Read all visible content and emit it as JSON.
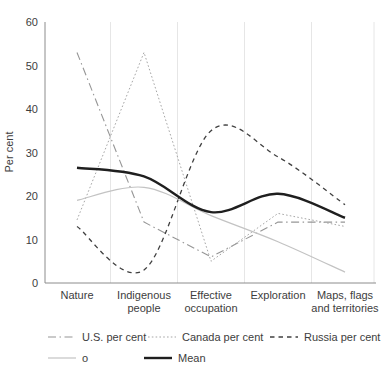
{
  "figure": {
    "background": "#ffffff",
    "ylabel": "Per cent"
  },
  "chart_data": {
    "type": "line",
    "title": "",
    "xlabel": "",
    "ylabel": "Per cent",
    "ylim": [
      0,
      60
    ],
    "yticks": [
      0,
      10,
      20,
      30,
      40,
      50,
      60
    ],
    "grid": "vertical light-gray lines at category band edges",
    "legend_position": "bottom, two rows",
    "categories": [
      "Nature",
      "Indigenous people",
      "Effective occupation",
      "Exploration",
      "Maps, flags and territories"
    ],
    "category_label_lines": [
      [
        "Nature"
      ],
      [
        "Indigenous",
        "people"
      ],
      [
        "Effective",
        "occupation"
      ],
      [
        "Exploration"
      ],
      [
        "Maps, flags",
        "and territories"
      ]
    ],
    "series": [
      {
        "name": "U.S. per cent",
        "values": [
          53,
          14,
          6,
          14,
          14
        ],
        "color": "#969696",
        "style": "dash-dot",
        "width": 1.1,
        "smooth": false
      },
      {
        "name": "Canada per cent",
        "values": [
          14.5,
          53,
          5,
          16,
          13
        ],
        "color": "#a6a6a6",
        "style": "dotted",
        "width": 1.0,
        "smooth": false
      },
      {
        "name": "Russia per cent",
        "values": [
          13,
          3,
          35,
          29,
          18
        ],
        "color": "#404040",
        "style": "dashed",
        "width": 1.3,
        "smooth": true
      },
      {
        "name": "o",
        "values": [
          19,
          22,
          15.5,
          9.5,
          2.5
        ],
        "color": "#c3c3c3",
        "style": "solid",
        "width": 1.2,
        "smooth": true
      },
      {
        "name": "Mean",
        "values": [
          26.5,
          24.5,
          16.3,
          20.5,
          15
        ],
        "color": "#1f1f1f",
        "style": "solid",
        "width": 2.4,
        "smooth": true
      }
    ],
    "axis_color": "#8c8c8c",
    "grid_color": "#e6e6e6",
    "text_color": "#3d3d3d"
  }
}
